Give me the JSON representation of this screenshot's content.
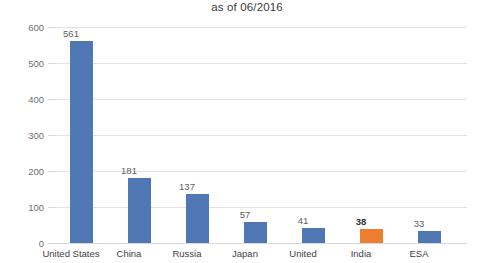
{
  "chart_data": {
    "type": "bar",
    "title": "as of 06/2016",
    "xlabel": "",
    "ylabel": "",
    "ylim": [
      0,
      600
    ],
    "yticks": [
      0,
      100,
      200,
      300,
      400,
      500,
      600
    ],
    "grid": true,
    "legend": "none",
    "categories": [
      "United States",
      "China",
      "Russia",
      "Japan",
      "United",
      "India",
      "ESA"
    ],
    "values": [
      561,
      181,
      137,
      57,
      41,
      38,
      33
    ],
    "value_labels": [
      "561",
      "181",
      "137",
      "57",
      "41",
      "38",
      "33"
    ],
    "highlight_index": 5,
    "colors": {
      "bar": "#4f77b3",
      "highlight_bar": "#ed7d31",
      "gridline": "#e2e2e2",
      "axis_line": "#d9d9d9",
      "title_text": "#3b3b3b",
      "tick_text": "#6f6f6f",
      "category_text": "#3f3f3f",
      "value_text": "#5e5e5e",
      "value_text_highlight": "#2f2f2f",
      "background": "#ffffff"
    }
  }
}
